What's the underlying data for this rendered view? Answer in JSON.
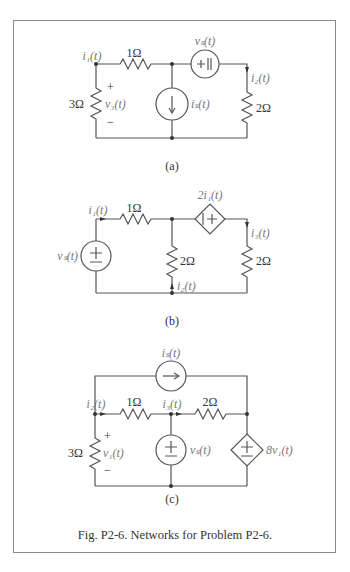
{
  "figure": {
    "caption": "Fig. P2-6. Networks for Problem P2-6.",
    "border_color": "#8a8a8a"
  },
  "circuits": {
    "a": {
      "label": "(a)",
      "current_label_i1": "i₁(t)",
      "resistor_top": "1Ω",
      "resistor_left": "3Ω",
      "voltage_label": "v₃(t)",
      "plus": "+",
      "minus": "−",
      "source_voltage_label": "vₛ(t)",
      "source_current_label": "iₛ(t)",
      "current_label_i2": "i₂(t)",
      "resistor_right": "2Ω"
    },
    "b": {
      "label": "(b)",
      "current_label_i1": "i₁(t)",
      "resistor_top": "1Ω",
      "source_voltage_label": "vₛ(t)",
      "dependent_source_label": "2i₁(t)",
      "resistor_middle": "2Ω",
      "resistor_right": "2Ω",
      "current_label_i2": "i₂(t)",
      "current_label_i3": "i₃(t)"
    },
    "c": {
      "label": "(c)",
      "source_current_label": "iₛ(t)",
      "current_label_i2": "i₂(t)",
      "current_label_i3": "i₃(t)",
      "resistor_top_left": "1Ω",
      "resistor_top_right": "2Ω",
      "resistor_left": "3Ω",
      "voltage_label": "v₁(t)",
      "plus": "+",
      "minus": "−",
      "source_voltage_label": "vₛ(t)",
      "dependent_source_label": "8v₁(t)"
    }
  }
}
